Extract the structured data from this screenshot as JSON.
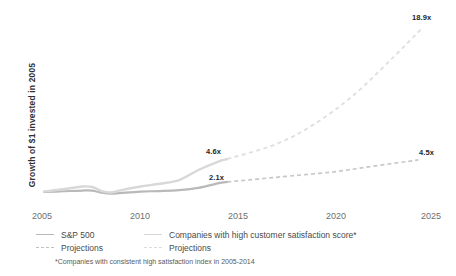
{
  "chart_data": {
    "type": "line",
    "title": "",
    "subtitle": "",
    "xlabel": "",
    "ylabel": "Growth of $1 invested  in 2005",
    "xlim": [
      2005,
      2025
    ],
    "ylim": [
      0,
      20
    ],
    "grid": false,
    "legend_position": "bottom-left",
    "xticks": [
      "2005",
      "2010",
      "2015",
      "2020",
      "2025"
    ],
    "yticks": [],
    "series": [
      {
        "name": "S&P 500",
        "style": "solid",
        "color": "#b9b9b9",
        "x": [
          2005,
          2006,
          2007,
          2007.5,
          2008,
          2008.5,
          2009,
          2010,
          2011,
          2012,
          2013,
          2014,
          2014.5
        ],
        "values": [
          1.0,
          1.08,
          1.16,
          1.15,
          0.92,
          0.82,
          0.9,
          1.05,
          1.1,
          1.2,
          1.45,
          1.95,
          2.1
        ]
      },
      {
        "name": "Companies with high customer satisfaction score*",
        "style": "solid",
        "color": "#d8d8d8",
        "x": [
          2005,
          2006,
          2007,
          2007.5,
          2008,
          2008.5,
          2009,
          2010,
          2011,
          2012,
          2013,
          2014,
          2014.5
        ],
        "values": [
          1.05,
          1.3,
          1.6,
          1.55,
          1.1,
          0.95,
          1.2,
          1.6,
          1.9,
          2.3,
          3.4,
          4.3,
          4.6
        ]
      },
      {
        "name": "Projections",
        "style": "dashed",
        "color": "#c8c8c8",
        "parent": "S&P 500",
        "x": [
          2014.5,
          2017,
          2020,
          2022,
          2024.4
        ],
        "values": [
          2.1,
          2.6,
          3.2,
          3.8,
          4.5
        ]
      },
      {
        "name": "Projections",
        "style": "dashed",
        "color": "#e0e0e0",
        "parent": "Companies with high customer satisfaction score*",
        "x": [
          2014.5,
          2017,
          2019,
          2021,
          2023,
          2024.6
        ],
        "values": [
          4.6,
          6.2,
          8.4,
          11.5,
          15.5,
          18.9
        ]
      }
    ],
    "annotations": [
      {
        "text": "4.6x",
        "x": 2014.2,
        "y": 4.6
      },
      {
        "text": "2.1x",
        "x": 2014.2,
        "y": 2.1
      },
      {
        "text": "18.9x",
        "x": 2024.6,
        "y": 18.9
      },
      {
        "text": "4.5x",
        "x": 2024.4,
        "y": 4.5
      }
    ],
    "footnote": "*Companies with consistent high satisfaction index in 2005-2014"
  },
  "legend": {
    "rows": [
      {
        "left": {
          "label": "S&P 500",
          "swatch": "solid-dark-gray-line-swatch"
        },
        "right": {
          "label": "Companies with high customer satisfaction score*",
          "swatch": "solid-light-gray-line-swatch"
        }
      },
      {
        "left": {
          "label": "Projections",
          "swatch": "dashed-dark-gray-line-swatch"
        },
        "right": {
          "label": "Projections",
          "swatch": "dashed-light-gray-line-swatch"
        }
      }
    ]
  },
  "colors": {
    "sp500_line": "#b9b9b9",
    "satisfaction_line": "#d8d8d8",
    "sp500_projection": "#c8c8c8",
    "satisfaction_projection": "#e0e0e0",
    "tick_text": "#6e6e6e",
    "label_text": "#1f1f1f",
    "background": "#ffffff"
  }
}
